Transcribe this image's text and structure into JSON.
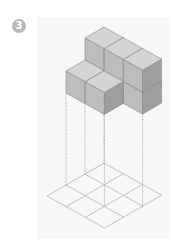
{
  "problem": {
    "number_label": "3"
  },
  "figure": {
    "grid": {
      "rows": 3,
      "cols": 3
    },
    "heights": [
      [
        2,
        2,
        2
      ],
      [
        1,
        1,
        0
      ],
      [
        0,
        0,
        0
      ]
    ],
    "colors": {
      "top_face": "#d4d4d4",
      "left_face": "#bdbdbd",
      "right_face": "#9e9e9e",
      "edge": "#8a8a8a",
      "grid_line": "#b5b5b5",
      "dotted_line": "#a0a0a0",
      "badge": "#b8b8b8"
    }
  }
}
